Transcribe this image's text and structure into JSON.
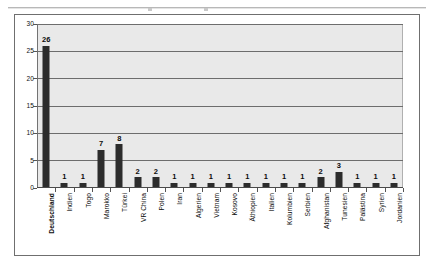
{
  "chart_data": {
    "type": "bar",
    "title": "",
    "xlabel": "",
    "ylabel": "",
    "ylim": [
      0,
      30
    ],
    "yticks": [
      0,
      5,
      10,
      15,
      20,
      25,
      30
    ],
    "grid": "horizontal",
    "legend": "none",
    "categories": [
      "Deutschland",
      "Indien",
      "Togo",
      "Marokko",
      "Türkei",
      "VR China",
      "Polen",
      "Iran",
      "Algerien",
      "Vietnam",
      "Kosovo",
      "Äthiopien",
      "Italien",
      "Kolumbien",
      "Serbien",
      "Afghanistan",
      "Tunesien",
      "Palästina",
      "Syrien",
      "Jordanien"
    ],
    "values": [
      26,
      1,
      1,
      7,
      8,
      2,
      2,
      1,
      1,
      1,
      1,
      1,
      1,
      1,
      1,
      2,
      3,
      1,
      1,
      1
    ],
    "data_labels": [
      "26",
      "1",
      "1",
      "7",
      "8",
      "2",
      "2",
      "1",
      "1",
      "1",
      "1",
      "1",
      "1",
      "1",
      "1",
      "2",
      "3",
      "1",
      "1",
      "1"
    ],
    "colors": {
      "bar": "#2c2c2c",
      "plot_background": "#e9e9e9",
      "gridline": "#6d6d6d",
      "axis": "#555555",
      "frame": "#6f6f6f",
      "text": "#0d0d0d",
      "page_background": "#ffffff"
    }
  }
}
